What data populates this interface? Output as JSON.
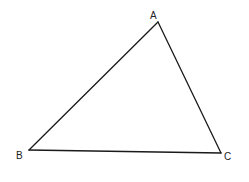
{
  "diagram": {
    "type": "triangle",
    "vertices": [
      {
        "label": "A",
        "x": 158,
        "y": 22
      },
      {
        "label": "B",
        "x": 29,
        "y": 150
      },
      {
        "label": "C",
        "x": 221,
        "y": 153
      }
    ],
    "edges": [
      [
        "A",
        "B"
      ],
      [
        "B",
        "C"
      ],
      [
        "C",
        "A"
      ]
    ],
    "colors": {
      "stroke": "#1a1a1a",
      "label": "#222222",
      "background": "#ffffff"
    }
  },
  "labels": {
    "a": "A",
    "b": "B",
    "c": "C"
  }
}
